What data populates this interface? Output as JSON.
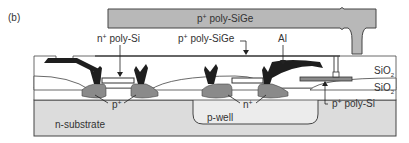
{
  "figure": {
    "panel_label": "(b)",
    "labels": {
      "top_sige": {
        "prefix": "p",
        "sup": "+",
        "text": " poly-SiGe"
      },
      "n_poly": {
        "prefix": "n",
        "sup": "+",
        "text": " poly-Si"
      },
      "p_sige": {
        "prefix": "p",
        "sup": "+",
        "text": " poly-SiGe"
      },
      "al": {
        "text": "Al"
      },
      "sio2_upper": {
        "text": "SiO",
        "sub": "2"
      },
      "sio2_lower": {
        "text": "SiO",
        "sub": "2"
      },
      "p_plus": {
        "prefix": "p",
        "sup": "+"
      },
      "n_plus": {
        "prefix": "n",
        "sup": "+"
      },
      "p_poly": {
        "prefix": "p",
        "sup": "+",
        "text": " poly-Si"
      },
      "n_substrate": {
        "text": "n-substrate"
      },
      "p_well": {
        "text": "p-well"
      }
    },
    "colors": {
      "sige": "#b8b8b8",
      "substrate": "#dcdcdc",
      "oxide": "#ffffff",
      "diffusion": "#8a8a8a",
      "metal": "#1e1e1e",
      "outline": "#444444"
    }
  }
}
